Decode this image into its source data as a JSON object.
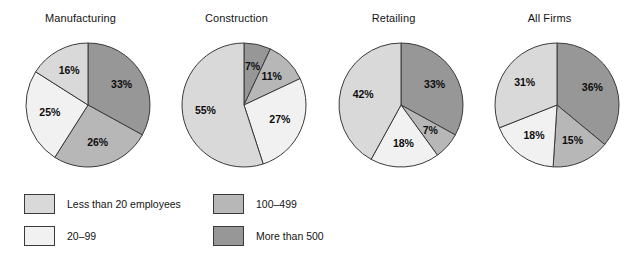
{
  "chart_data": {
    "type": "pie",
    "title": "",
    "legend_position": "bottom",
    "categories": [
      "Less than 20 employees",
      "20–99",
      "100–499",
      "More than 500"
    ],
    "category_colors": [
      "#d9d9d9",
      "#f1f1f1",
      "#b7b7b7",
      "#979797"
    ],
    "charts": [
      {
        "title": "Manufacturing",
        "labels": [
          "More than 500",
          "100–499",
          "20–99",
          "Less than 20 employees"
        ],
        "values": [
          33,
          26,
          25,
          16
        ],
        "display_values": [
          "33%",
          "26%",
          "25%",
          "16%"
        ],
        "colors": [
          "#979797",
          "#b7b7b7",
          "#f1f1f1",
          "#d9d9d9"
        ]
      },
      {
        "title": "Construction",
        "labels": [
          "More than 500",
          "100–499",
          "20–99",
          "Less than 20 employees"
        ],
        "values": [
          7,
          11,
          27,
          55
        ],
        "display_values": [
          "7%",
          "11%",
          "27%",
          "55%"
        ],
        "colors": [
          "#979797",
          "#b7b7b7",
          "#f1f1f1",
          "#d9d9d9"
        ]
      },
      {
        "title": "Retailing",
        "labels": [
          "More than 500",
          "100–499",
          "20–99",
          "Less than 20 employees"
        ],
        "values": [
          33,
          7,
          18,
          42
        ],
        "display_values": [
          "33%",
          "7%",
          "18%",
          "42%"
        ],
        "colors": [
          "#979797",
          "#b7b7b7",
          "#f1f1f1",
          "#d9d9d9"
        ]
      },
      {
        "title": "All Firms",
        "labels": [
          "More than 500",
          "100–499",
          "20–99",
          "Less than 20 employees"
        ],
        "values": [
          36,
          15,
          18,
          31
        ],
        "display_values": [
          "36%",
          "15%",
          "18%",
          "31%"
        ],
        "colors": [
          "#979797",
          "#b7b7b7",
          "#f1f1f1",
          "#d9d9d9"
        ]
      }
    ]
  },
  "legend": {
    "items": [
      {
        "label": "Less than 20 employees",
        "color": "#d9d9d9"
      },
      {
        "label": "20–99",
        "color": "#f1f1f1"
      },
      {
        "label": "100–499",
        "color": "#b7b7b7"
      },
      {
        "label": "More than 500",
        "color": "#979797"
      }
    ]
  }
}
